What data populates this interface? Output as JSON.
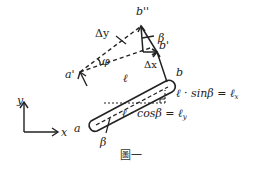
{
  "diagram": {
    "points": {
      "b_double_prime": "b''",
      "b_prime": "b'",
      "a_prime": "a'",
      "a": "a",
      "b": "b"
    },
    "symbols": {
      "delta_y": "Δy",
      "delta_x": "Δx",
      "phi": "φ",
      "beta_upper": "β",
      "beta_lower": "β",
      "ell": "ℓ"
    },
    "equations": {
      "sin_lhs": "ℓ · sin",
      "sin_beta": "β",
      "sin_eq": " = ",
      "sin_rhs": "ℓ",
      "sin_rhs_sub": "x",
      "cos_lhs": "ℓ · cos",
      "cos_beta": "β",
      "cos_eq": " = ",
      "cos_rhs": "ℓ",
      "cos_rhs_sub": "y"
    },
    "axes": {
      "x_label": "x",
      "y_label": "y"
    },
    "caption": "圖一",
    "colors": {
      "ink": "#222222",
      "background": "#ffffff"
    }
  }
}
